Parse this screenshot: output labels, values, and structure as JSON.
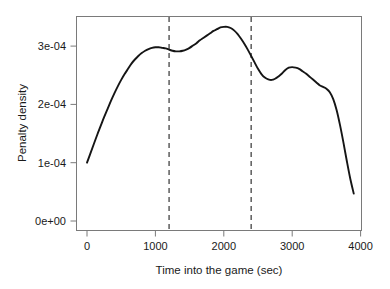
{
  "chart_data": {
    "type": "line",
    "title": "",
    "subtitle": "",
    "xlabel": "Time into the game (sec)",
    "ylabel": "Penalty density",
    "xlim": [
      -100,
      4100
    ],
    "ylim": [
      -1.2e-05,
      0.000355
    ],
    "grid": false,
    "legend": null,
    "x_ticks": [
      0,
      1000,
      2000,
      3000,
      4000
    ],
    "x_tick_labels": [
      "0",
      "1000",
      "2000",
      "3000",
      "4000"
    ],
    "y_ticks": [
      0,
      0.0001,
      0.0002,
      0.0003
    ],
    "y_tick_labels": [
      "0e+00",
      "1e-04",
      "2e-04",
      "3e-04"
    ],
    "series": [
      {
        "name": "Penalty density",
        "color": "#151515",
        "x": [
          0,
          50,
          100,
          150,
          200,
          250,
          300,
          350,
          400,
          450,
          500,
          550,
          600,
          650,
          700,
          750,
          800,
          850,
          900,
          950,
          1000,
          1050,
          1100,
          1150,
          1200,
          1250,
          1300,
          1350,
          1400,
          1450,
          1500,
          1550,
          1600,
          1650,
          1700,
          1750,
          1800,
          1850,
          1900,
          1950,
          2000,
          2050,
          2100,
          2150,
          2200,
          2250,
          2300,
          2350,
          2400,
          2450,
          2500,
          2550,
          2600,
          2650,
          2700,
          2750,
          2800,
          2850,
          2900,
          2950,
          3000,
          3050,
          3100,
          3150,
          3200,
          3250,
          3300,
          3350,
          3400,
          3450,
          3500,
          3550,
          3600,
          3650,
          3700,
          3750,
          3800,
          3850,
          3900
        ],
        "y": [
          0.0001,
          0.000116,
          0.000132,
          0.000148,
          0.000163,
          0.000178,
          0.000192,
          0.000206,
          0.000219,
          0.000231,
          0.000242,
          0.000252,
          0.000261,
          0.00027,
          0.000277,
          0.000283,
          0.000288,
          0.000292,
          0.000295,
          0.000297,
          0.000298,
          0.000298,
          0.000297,
          0.000296,
          0.000294,
          0.000292,
          0.000291,
          0.000291,
          0.000292,
          0.000294,
          0.000297,
          0.000301,
          0.000305,
          0.00031,
          0.000314,
          0.000318,
          0.000322,
          0.000326,
          0.000329,
          0.000332,
          0.000333,
          0.000333,
          0.000331,
          0.000327,
          0.000321,
          0.000313,
          0.000304,
          0.000294,
          0.000283,
          0.000272,
          0.000261,
          0.000252,
          0.000246,
          0.000243,
          0.000242,
          0.000244,
          0.000248,
          0.000253,
          0.000259,
          0.000263,
          0.000264,
          0.000263,
          0.000261,
          0.000257,
          0.000253,
          0.000248,
          0.000243,
          0.000238,
          0.000233,
          0.00023,
          0.000227,
          0.000221,
          0.000209,
          0.00019,
          0.000164,
          0.000134,
          0.000102,
          7.2e-05,
          4.7e-05
        ]
      }
    ],
    "annotations": [
      {
        "type": "vline",
        "name": "period-marker-1",
        "x": 1200,
        "style": "dashed",
        "color": "#4a4a4a"
      },
      {
        "type": "vline",
        "name": "period-marker-2",
        "x": 2400,
        "style": "dashed",
        "color": "#4a4a4a"
      }
    ]
  }
}
